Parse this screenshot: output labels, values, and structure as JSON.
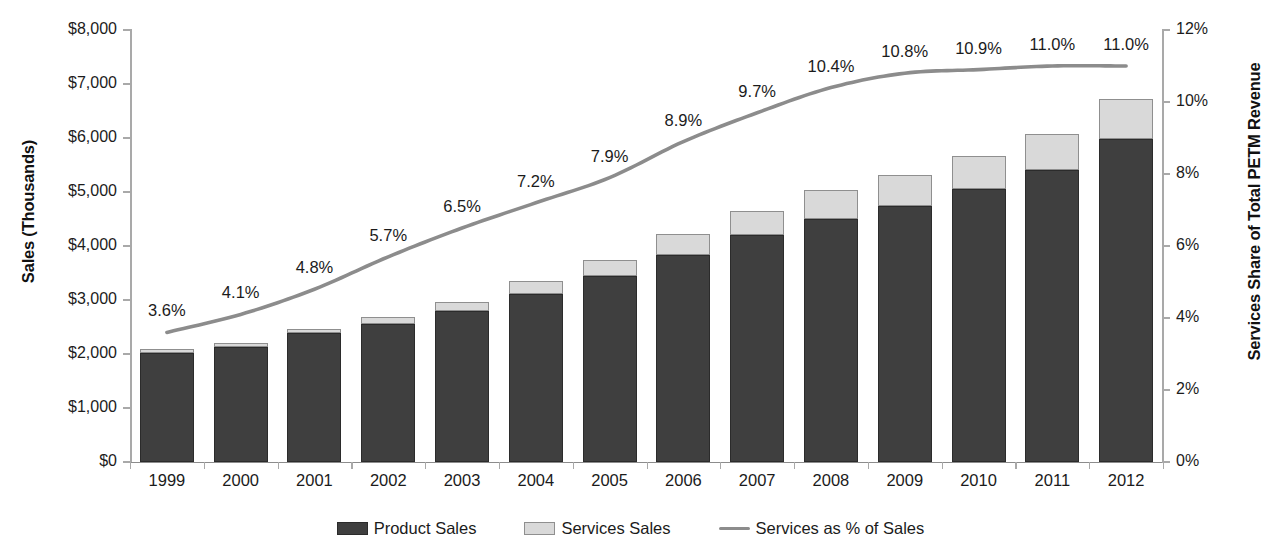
{
  "chart_data": {
    "type": "bar",
    "title": "",
    "subtitle": "",
    "xlabel": "",
    "ylabel": "Sales (Thousands)",
    "y2label": "Services Share of Total PETM Revenue",
    "grid": false,
    "legend_position": "bottom",
    "categories": [
      "1999",
      "2000",
      "2001",
      "2002",
      "2003",
      "2004",
      "2005",
      "2006",
      "2007",
      "2008",
      "2009",
      "2010",
      "2011",
      "2012"
    ],
    "ylim": [
      0,
      8000
    ],
    "y_ticks": [
      0,
      1000,
      2000,
      3000,
      4000,
      5000,
      6000,
      7000,
      8000
    ],
    "y_tick_labels": [
      "$0",
      "$1,000",
      "$2,000",
      "$3,000",
      "$4,000",
      "$5,000",
      "$6,000",
      "$7,000",
      "$8,000"
    ],
    "y2lim": [
      0,
      12
    ],
    "y2_ticks": [
      0,
      2,
      4,
      6,
      8,
      10,
      12
    ],
    "y2_tick_labels": [
      "0%",
      "2%",
      "4%",
      "6%",
      "8%",
      "10%",
      "12%"
    ],
    "series": [
      {
        "name": "Product Sales",
        "type": "bar",
        "stack": "sales",
        "axis": "left",
        "color": "#3f3f3f",
        "values": [
          2010,
          2130,
          2390,
          2550,
          2790,
          3110,
          3450,
          3840,
          4200,
          4500,
          4740,
          5050,
          5410,
          5980
        ]
      },
      {
        "name": "Services Sales",
        "type": "bar",
        "stack": "sales",
        "axis": "left",
        "color": "#d9d9d9",
        "values": [
          80,
          70,
          80,
          130,
          180,
          240,
          290,
          380,
          450,
          540,
          580,
          620,
          670,
          740
        ]
      },
      {
        "name": "Services as % of Sales",
        "type": "line",
        "axis": "right",
        "color": "#8c8c8c",
        "values": [
          3.6,
          4.1,
          4.8,
          5.7,
          6.5,
          7.2,
          7.9,
          8.9,
          9.7,
          10.4,
          10.8,
          10.9,
          11.0,
          11.0
        ],
        "data_labels": [
          "3.6%",
          "4.1%",
          "4.8%",
          "5.7%",
          "6.5%",
          "7.2%",
          "7.9%",
          "8.9%",
          "9.7%",
          "10.4%",
          "10.8%",
          "10.9%",
          "11.0%",
          "11.0%"
        ]
      }
    ],
    "totals": [
      2090,
      2200,
      2470,
      2680,
      2970,
      3350,
      3740,
      4220,
      4650,
      5040,
      5320,
      5670,
      6080,
      6720
    ]
  },
  "legend": {
    "items": [
      {
        "label": "Product Sales",
        "swatch": "product"
      },
      {
        "label": "Services Sales",
        "swatch": "services"
      },
      {
        "label": "Services as % of Sales",
        "swatch": "line"
      }
    ]
  }
}
